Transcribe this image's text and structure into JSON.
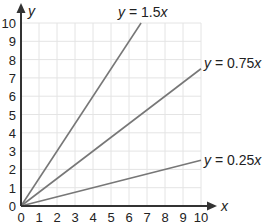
{
  "chart_data": {
    "type": "line",
    "title": "",
    "xlabel": "x",
    "ylabel": "y",
    "xlim": [
      0,
      10
    ],
    "ylim": [
      0,
      10
    ],
    "grid": true,
    "x_ticks": [
      "0",
      "1",
      "2",
      "3",
      "4",
      "5",
      "6",
      "7",
      "8",
      "9",
      "10"
    ],
    "y_ticks": [
      "0",
      "1",
      "2",
      "3",
      "4",
      "5",
      "6",
      "7",
      "8",
      "9",
      "10"
    ],
    "series": [
      {
        "name": "y = 1.5x",
        "slope": 1.5,
        "points": [
          [
            0,
            0
          ],
          [
            6.67,
            10
          ]
        ],
        "label_text": {
          "pre": "y",
          "mid": " = 1.5",
          "post": "x"
        }
      },
      {
        "name": "y = 0.75x",
        "slope": 0.75,
        "points": [
          [
            0,
            0
          ],
          [
            10,
            7.5
          ]
        ],
        "label_text": {
          "pre": "y",
          "mid": " = 0.75",
          "post": "x"
        }
      },
      {
        "name": "y = 0.25x",
        "slope": 0.25,
        "points": [
          [
            0,
            0
          ],
          [
            10,
            2.5
          ]
        ],
        "label_text": {
          "pre": "y",
          "mid": " = 0.25",
          "post": "x"
        }
      }
    ],
    "legend": "inline labels at line ends"
  },
  "colors": {
    "line": "#777777",
    "axis": "#333333",
    "grid": "#e4e4e4"
  }
}
